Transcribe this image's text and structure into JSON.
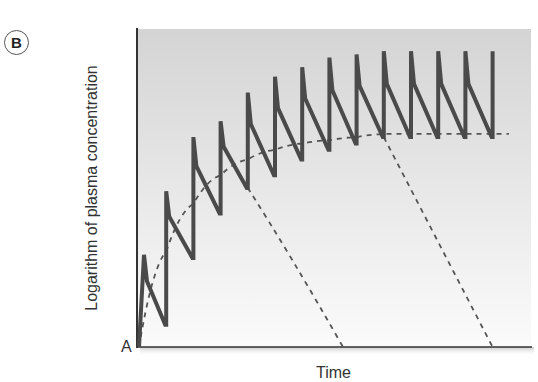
{
  "panel": {
    "label": "B"
  },
  "chart_data": {
    "type": "line",
    "title": "",
    "panel_label": "B",
    "xlabel": "Time",
    "ylabel": "Logarithm of plasma concentration",
    "origin_label": "A",
    "xlim": [
      0,
      14.6
    ],
    "ylim": [
      0,
      100
    ],
    "grid": false,
    "legend": null,
    "x_units": "dose intervals (unlabeled)",
    "y_units": "relative log concentration (unlabeled, 0-100)",
    "background": {
      "gradient_top": "#d4d4d4",
      "gradient_bottom": "#fbfbfb"
    },
    "series": [
      {
        "name": "Plasma concentration (repeated dosing)",
        "style": "solid",
        "color": "#4a4a4a",
        "width": 4,
        "dose_times": [
          0,
          1,
          2,
          3,
          4,
          5,
          6,
          7,
          8,
          9,
          10,
          11,
          12,
          13
        ],
        "peaks": [
          29,
          49,
          66,
          71,
          80,
          85,
          88,
          91,
          92,
          93,
          93,
          93,
          93,
          93
        ],
        "troughs": [
          7,
          28,
          42,
          50,
          54,
          59,
          62,
          64,
          66,
          66,
          66,
          66,
          66,
          66
        ]
      },
      {
        "name": "Mean concentration approach to steady state",
        "style": "dashed",
        "color": "#555555",
        "x": [
          0,
          1,
          2,
          3,
          4,
          5,
          6,
          7,
          8,
          9,
          10,
          11,
          12,
          13,
          13.6
        ],
        "y": [
          0,
          30,
          45,
          54,
          59,
          62,
          64,
          65,
          66,
          67,
          67,
          67,
          67,
          67,
          67
        ]
      },
      {
        "name": "Washout decay after stopping (early)",
        "style": "dashed",
        "color": "#555555",
        "x": [
          4,
          5.5,
          7.5
        ],
        "y": [
          50,
          30,
          0
        ]
      },
      {
        "name": "Washout decay after stopping (steady state)",
        "style": "dashed",
        "color": "#555555",
        "x": [
          9,
          11,
          13
        ],
        "y": [
          66,
          33,
          0
        ]
      }
    ],
    "annotations": [
      {
        "text": "Css",
        "meaning": "steady-state concentration",
        "y": 77
      },
      {
        "text": "A",
        "position": "origin"
      }
    ]
  },
  "labels": {
    "y_axis": "Logarithm of plasma concentration",
    "x_axis": "Time",
    "origin": "A",
    "css_main": "C",
    "css_sub": "ss"
  }
}
